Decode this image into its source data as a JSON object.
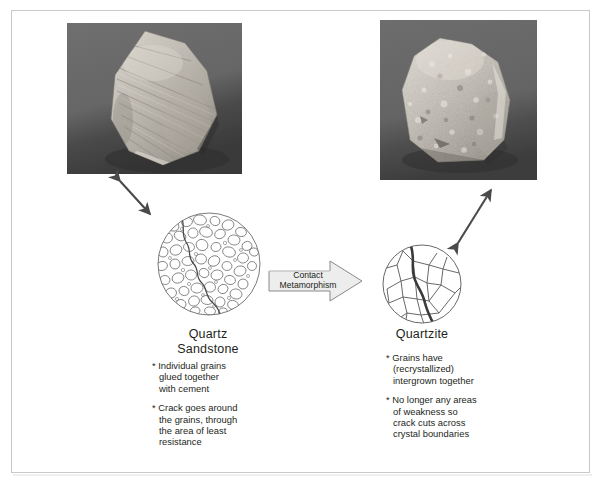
{
  "figure": {
    "background_color": "#ffffff",
    "frame_color": "#c9c9c9",
    "text_color": "#231f20"
  },
  "left": {
    "photo_alt": "quartz-sandstone-hand-sample-photo",
    "micrograph_alt": "sandstone-grain-texture-circle",
    "caption_line1": "Quartz",
    "caption_line2": "Sandstone",
    "bullets": [
      "* Individual grains\nglued together\nwith cement",
      "* Crack goes around\nthe grains, through\nthe area of least\nresistance"
    ]
  },
  "right": {
    "photo_alt": "quartzite-hand-sample-photo",
    "micrograph_alt": "quartzite-interlocking-crystal-circle",
    "caption_line1": "Quartzite",
    "bullets": [
      "* Grains have\n(recrystallized)\nintergrown together",
      "* No longer any areas\nof weakness so\ncrack cuts across\ncrystal boundaries"
    ]
  },
  "process_arrow": {
    "label_line1": "Contact",
    "label_line2": "Metamorphism",
    "fill_color": "#ededed",
    "stroke_color": "#8a8a8a"
  },
  "connector_arrows": {
    "left_label": "sample-to-micrograph-link-left",
    "right_label": "sample-to-micrograph-link-right",
    "color": "#4a4a4a"
  }
}
